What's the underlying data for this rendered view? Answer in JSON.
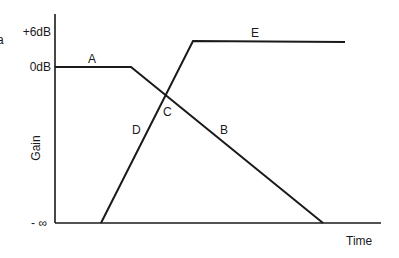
{
  "diagram": {
    "type": "gain-over-time crossfade diagram",
    "y_axis": {
      "title": "Gain",
      "ticks": [
        "+6dB",
        "0dB",
        "- ∞"
      ]
    },
    "x_axis": {
      "title": "Time"
    },
    "cropped_left_text": "a",
    "segments": [
      {
        "label": "A",
        "description": "flat at 0dB"
      },
      {
        "label": "B",
        "description": "fade down from 0dB to -∞"
      },
      {
        "label": "C",
        "description": "crossover point"
      },
      {
        "label": "D",
        "description": "fade up from -∞ to +6dB"
      },
      {
        "label": "E",
        "description": "flat at +6dB"
      }
    ],
    "line_color": "#1a1a1a"
  }
}
